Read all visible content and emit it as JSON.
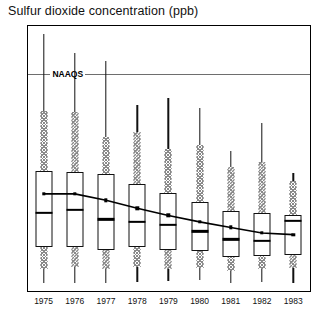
{
  "chart_data": {
    "type": "box",
    "title": "Sulfur dioxide concentration (ppb)",
    "xlabel": "",
    "ylabel": "Sulfur dioxide concentration (ppb)",
    "ylim": [
      3,
      36
    ],
    "yticks": [
      5,
      10,
      15,
      20,
      25,
      30,
      35
    ],
    "ytick_labels": [
      "5",
      "10",
      "15",
      "20",
      "25",
      "30",
      "35"
    ],
    "grid": false,
    "legend": "none",
    "categories": [
      "1975",
      "1976",
      "1977",
      "1978",
      "1979",
      "1980",
      "1981",
      "1982",
      "1983"
    ],
    "reference_lines": [
      {
        "label": "NAAQS",
        "value": 30,
        "color": "#6e6e6e"
      }
    ],
    "series": [
      {
        "name": "mean",
        "type": "line",
        "marker": "square",
        "color": "#000000",
        "values": [
          15.0,
          15.0,
          14.2,
          13.2,
          12.3,
          11.5,
          10.8,
          10.1,
          9.9
        ]
      }
    ],
    "boxes": [
      {
        "category": "1975",
        "whisker_high": 35.0,
        "upper_hatch_top": 25.4,
        "q3": 17.9,
        "median": 12.6,
        "q1": 8.3,
        "lower_hatch_bottom": 5.6,
        "whisker_low": 3.9,
        "mean": 15.0
      },
      {
        "category": "1976",
        "whisker_high": 32.6,
        "upper_hatch_top": 25.3,
        "q3": 17.7,
        "median": 13.0,
        "q1": 8.4,
        "lower_hatch_bottom": 5.8,
        "whisker_low": 3.8,
        "mean": 15.0
      },
      {
        "category": "1977",
        "whisker_high": 31.6,
        "upper_hatch_top": 22.1,
        "q3": 17.5,
        "median": 11.8,
        "q1": 8.0,
        "lower_hatch_bottom": 5.6,
        "whisker_low": 3.9,
        "mean": 14.2
      },
      {
        "category": "1978",
        "whisker_high": 26.1,
        "upper_hatch_top": 22.8,
        "q3": 16.2,
        "median": 11.5,
        "q1": 8.3,
        "lower_hatch_bottom": 5.8,
        "whisker_low": 4.0,
        "mean": 13.2
      },
      {
        "category": "1979",
        "whisker_high": 27.0,
        "upper_hatch_top": 20.6,
        "q3": 15.1,
        "median": 11.1,
        "q1": 8.0,
        "lower_hatch_bottom": 5.6,
        "whisker_low": 4.1,
        "mean": 12.3
      },
      {
        "category": "1980",
        "whisker_high": 25.7,
        "upper_hatch_top": 21.1,
        "q3": 14.0,
        "median": 10.3,
        "q1": 7.8,
        "lower_hatch_bottom": 5.7,
        "whisker_low": 4.2,
        "mean": 11.5
      },
      {
        "category": "1981",
        "whisker_high": 20.4,
        "upper_hatch_top": 18.4,
        "q3": 12.8,
        "median": 9.3,
        "q1": 7.1,
        "lower_hatch_bottom": 5.4,
        "whisker_low": 3.9,
        "mean": 10.8
      },
      {
        "category": "1982",
        "whisker_high": 23.9,
        "upper_hatch_top": 19.0,
        "q3": 12.6,
        "median": 9.1,
        "q1": 7.2,
        "lower_hatch_bottom": 5.6,
        "whisker_low": 4.0,
        "mean": 10.1
      },
      {
        "category": "1983",
        "whisker_high": 17.6,
        "upper_hatch_top": 16.6,
        "q3": 12.4,
        "median": 11.6,
        "q1": 7.4,
        "lower_hatch_bottom": 5.7,
        "whisker_low": 3.9,
        "mean": 9.9
      }
    ]
  }
}
